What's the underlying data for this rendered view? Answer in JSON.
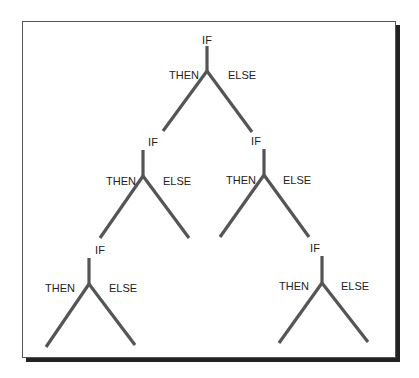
{
  "diagram": {
    "colors": {
      "line": "#555555",
      "text": "#222222",
      "frame": "#555555",
      "shadow": "#222222"
    },
    "nodes": [
      {
        "id": "root",
        "if_label": "IF",
        "then_label": "THEN",
        "else_label": "ELSE",
        "label_pos": [
          207,
          43
        ],
        "stem": [
          207,
          46,
          207,
          71
        ],
        "left_end": [
          163,
          131
        ],
        "right_end": [
          252,
          132
        ],
        "then_pos": [
          186,
          79
        ],
        "else_pos": [
          230,
          79
        ]
      },
      {
        "id": "mid-left",
        "if_label": "IF",
        "then_label": "THEN",
        "else_label": "ELSE",
        "label_pos": [
          153,
          146
        ],
        "stem": [
          143,
          150,
          143,
          176
        ],
        "left_end": [
          100,
          238
        ],
        "right_end": [
          189,
          238
        ],
        "then_pos": [
          128,
          185
        ],
        "else_pos": [
          162,
          185
        ]
      },
      {
        "id": "mid-right",
        "if_label": "IF",
        "then_label": "THEN",
        "else_label": "ELSE",
        "label_pos": [
          257,
          145
        ],
        "stem": [
          264,
          149,
          264,
          175
        ],
        "left_end": [
          220,
          237
        ],
        "right_end": [
          309,
          237
        ],
        "then_pos": [
          249,
          184
        ],
        "else_pos": [
          283,
          184
        ]
      },
      {
        "id": "bottom-left",
        "if_label": "IF",
        "then_label": "THEN",
        "else_label": "ELSE",
        "label_pos": [
          101,
          254
        ],
        "stem": [
          89,
          258,
          89,
          284
        ],
        "left_end": [
          46,
          347
        ],
        "right_end": [
          135,
          345
        ],
        "then_pos": [
          73,
          292
        ],
        "else_pos": [
          108,
          292
        ]
      },
      {
        "id": "bottom-right",
        "if_label": "IF",
        "then_label": "THEN",
        "else_label": "ELSE",
        "label_pos": [
          316,
          252
        ],
        "stem": [
          322,
          256,
          322,
          283
        ],
        "left_end": [
          279,
          343
        ],
        "right_end": [
          368,
          342
        ],
        "then_pos": [
          308,
          290
        ],
        "else_pos": [
          341,
          290
        ]
      }
    ]
  }
}
